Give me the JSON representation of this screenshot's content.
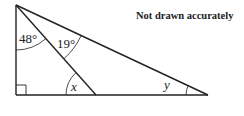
{
  "diagram": {
    "note": "Not drawn accurately",
    "labels": {
      "angle_top_left": "48°",
      "angle_top_middle": "19°",
      "angle_x": "x",
      "angle_y": "y"
    },
    "points": {
      "apex": [
        16,
        5
      ],
      "right_angle_corner": [
        16,
        95
      ],
      "inner_foot": [
        96,
        95
      ],
      "right_vertex": [
        208,
        95
      ]
    },
    "colors": {
      "stroke": "#222222",
      "background": "#ffffff"
    }
  }
}
